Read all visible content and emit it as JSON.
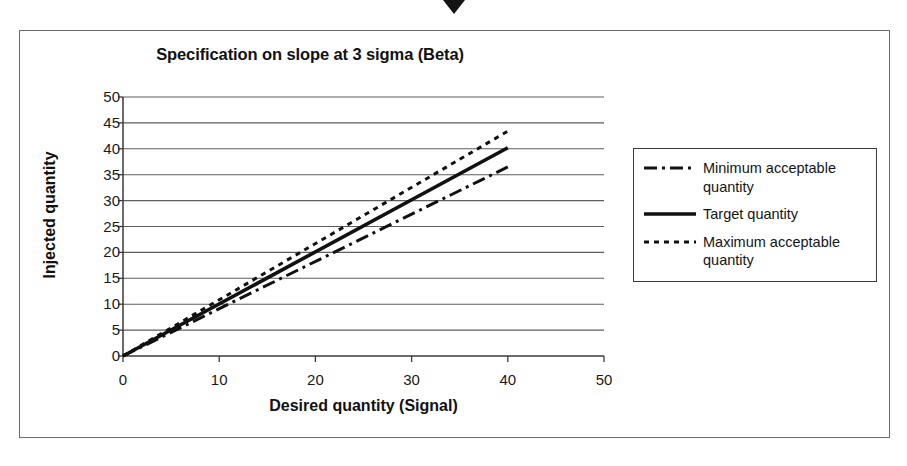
{
  "figure": {
    "top_marker_icon": "down-triangle-marker"
  },
  "chart_data": {
    "type": "line",
    "title": "Specification on slope at 3 sigma (Beta)",
    "xlabel": "Desired quantity (Signal)",
    "ylabel": "Injected quantity",
    "xlim": [
      0,
      50
    ],
    "ylim": [
      0,
      50
    ],
    "xticks": [
      0,
      10,
      20,
      30,
      40,
      50
    ],
    "yticks": [
      0,
      5,
      10,
      15,
      20,
      25,
      30,
      35,
      40,
      45,
      50
    ],
    "grid": "horizontal",
    "legend_position": "right",
    "series": [
      {
        "name": "Minimum acceptable quantity",
        "style": "dash-dot",
        "color": "#111111",
        "x": [
          0,
          40
        ],
        "y": [
          0,
          36.5
        ],
        "slope": 0.9125
      },
      {
        "name": "Target quantity",
        "style": "solid",
        "color": "#111111",
        "x": [
          0,
          40
        ],
        "y": [
          0,
          40.2
        ],
        "slope": 1.005
      },
      {
        "name": "Maximum acceptable quantity",
        "style": "dotted",
        "color": "#111111",
        "x": [
          0,
          40
        ],
        "y": [
          0,
          43.4
        ],
        "slope": 1.085
      }
    ]
  },
  "legend": {
    "items": [
      {
        "label": "Minimum acceptable quantity",
        "swatch": "dash-dot-line-swatch"
      },
      {
        "label": "Target quantity",
        "swatch": "solid-line-swatch"
      },
      {
        "label": "Maximum acceptable quantity",
        "swatch": "dashed-line-swatch"
      }
    ]
  }
}
